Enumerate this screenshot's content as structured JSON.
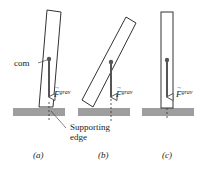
{
  "figure": {
    "labels": {
      "com": "com",
      "force": "F",
      "force_superscript": "grav",
      "supporting_edge_line1": "Supporting",
      "supporting_edge_line2": "edge"
    },
    "panels": [
      {
        "id": "a",
        "caption": "(a)"
      },
      {
        "id": "b",
        "caption": "(b)"
      },
      {
        "id": "c",
        "caption": "(c)"
      }
    ],
    "colors": {
      "ground": "#9e9e9e",
      "outline": "#333333",
      "force_arrow": "#555555",
      "com_dot": "#555555",
      "dashed_line": "#333333",
      "text": "#222222"
    }
  }
}
